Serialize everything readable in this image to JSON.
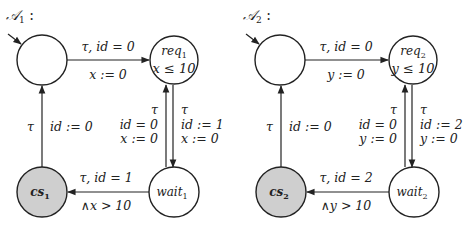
{
  "colors": {
    "line": "#222222",
    "accent_state_fill": "#cfcfcf",
    "background": "#ffffff"
  },
  "automata": [
    {
      "title": "𝒜",
      "title_sub": "1",
      "title_suffix": " :",
      "states": {
        "init": {
          "label": ""
        },
        "req": {
          "label": "req",
          "sub": "1",
          "invariant": "x ≤ 10"
        },
        "wait": {
          "label": "wait",
          "sub": "1"
        },
        "cs": {
          "label": "cs",
          "sub": "1"
        }
      },
      "edges": {
        "init_to_req": {
          "guard": "τ, id = 0",
          "update": "x := 0"
        },
        "req_to_wait": {
          "action": "τ",
          "update1": "id := 1",
          "update2": "x := 0"
        },
        "wait_to_req": {
          "action": "τ",
          "guard": "id = 0",
          "update": "x := 0"
        },
        "wait_to_cs": {
          "guard": "τ, id = 1",
          "guard2": "∧x > 10"
        },
        "cs_to_init": {
          "action": "τ",
          "update": "id := 0"
        }
      }
    },
    {
      "title": "𝒜",
      "title_sub": "2",
      "title_suffix": " :",
      "states": {
        "init": {
          "label": ""
        },
        "req": {
          "label": "req",
          "sub": "2",
          "invariant": "y ≤ 10"
        },
        "wait": {
          "label": "wait",
          "sub": "2"
        },
        "cs": {
          "label": "cs",
          "sub": "2"
        }
      },
      "edges": {
        "init_to_req": {
          "guard": "τ, id = 0",
          "update": "y := 0"
        },
        "req_to_wait": {
          "action": "τ",
          "update1": "id := 2",
          "update2": "y := 0"
        },
        "wait_to_req": {
          "action": "τ",
          "guard": "id = 0",
          "update": "y := 0"
        },
        "wait_to_cs": {
          "guard": "τ, id = 2",
          "guard2": "∧y > 10"
        },
        "cs_to_init": {
          "action": "τ",
          "update": "id := 0"
        }
      }
    }
  ]
}
